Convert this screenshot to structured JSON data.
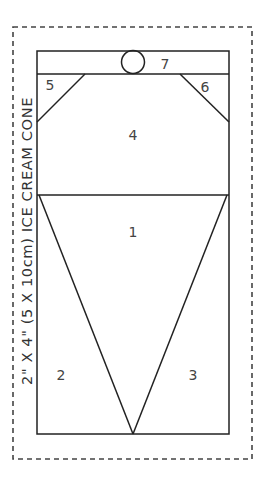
{
  "title": "2\" X 4\" (5 X 10cm) ICE CREAM CONE",
  "colors": {
    "line": "#222222",
    "dash": "#444444",
    "text": "#444444",
    "background": "#ffffff"
  },
  "pieces": [
    {
      "id": "1",
      "label": "1",
      "x": 133,
      "y": 237
    },
    {
      "id": "2",
      "label": "2",
      "x": 61,
      "y": 380
    },
    {
      "id": "3",
      "label": "3",
      "x": 193,
      "y": 380
    },
    {
      "id": "4",
      "label": "4",
      "x": 133,
      "y": 140
    },
    {
      "id": "5",
      "label": "5",
      "x": 50,
      "y": 90
    },
    {
      "id": "6",
      "label": "6",
      "x": 205,
      "y": 92
    },
    {
      "id": "7",
      "label": "7",
      "x": 165,
      "y": 69
    }
  ]
}
